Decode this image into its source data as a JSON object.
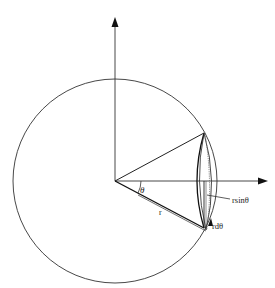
{
  "diagram": {
    "labels": {
      "theta": "θ",
      "r": "r",
      "r_sin_theta": "rsinθ",
      "r_d_theta": "rdθ"
    },
    "colors": {
      "line": "#222222",
      "background": "#ffffff"
    },
    "geometry": {
      "origin": [
        115,
        181
      ],
      "radius": 102,
      "vertical_axis_top": 18,
      "horizontal_axis_right": 268
    }
  }
}
